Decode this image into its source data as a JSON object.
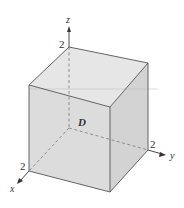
{
  "diagram": {
    "type": "3d-cube-region",
    "region_label": "D",
    "axes": {
      "x": {
        "label": "x",
        "tick": "2"
      },
      "y": {
        "label": "y",
        "tick": "2"
      },
      "z": {
        "label": "z",
        "tick": "2"
      }
    },
    "colors": {
      "face_top": "#e4e4e4",
      "face_front": "#dadada",
      "face_right": "#d2d2d2",
      "edge": "#555555",
      "hidden": "#777777",
      "axis": "#333333"
    }
  }
}
